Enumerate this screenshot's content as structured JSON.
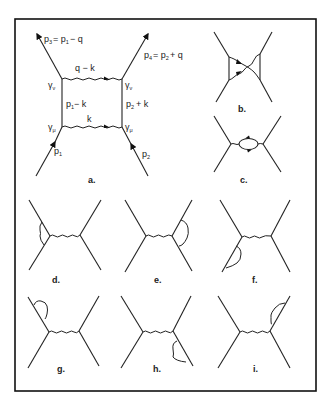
{
  "figure": {
    "panels": [
      {
        "id": "a",
        "caption": "a.",
        "description": "box diagram"
      },
      {
        "id": "b",
        "caption": "b.",
        "description": "crossed box diagram"
      },
      {
        "id": "c",
        "caption": "c.",
        "description": "vacuum polarization"
      },
      {
        "id": "d",
        "caption": "d.",
        "description": "vertex correction left"
      },
      {
        "id": "e",
        "caption": "e.",
        "description": "vertex correction right"
      },
      {
        "id": "f",
        "caption": "f.",
        "description": "self-energy lower-left leg"
      },
      {
        "id": "g",
        "caption": "g.",
        "description": "self-energy upper-left leg"
      },
      {
        "id": "h",
        "caption": "h.",
        "description": "self-energy lower-right leg"
      },
      {
        "id": "i",
        "caption": "i.",
        "description": "self-energy upper-right leg"
      }
    ],
    "panel_a_labels": {
      "p3": "p",
      "p3_sub": "3",
      "p3_eq": "= p",
      "p3_eq_sub": "1",
      "p3_rest": "− q",
      "p4": "p",
      "p4_sub": "4",
      "p4_eq": "= p",
      "p4_eq_sub": "2",
      "p4_rest": "+ q",
      "top_photon": "q − k",
      "bottom_photon": "k",
      "left_prop": "p",
      "left_prop_sub": "1",
      "left_prop_rest": "− k",
      "right_prop": "p",
      "right_prop_sub": "2",
      "right_prop_rest": "+ k",
      "gamma_nu_left": "γ",
      "gamma_nu_left_sub": "ν",
      "gamma_nu_right": "γ",
      "gamma_nu_right_sub": "ν",
      "gamma_mu_left": "γ",
      "gamma_mu_left_sub": "μ",
      "gamma_mu_right": "γ",
      "gamma_mu_right_sub": "μ",
      "p1": "p",
      "p1_sub": "1",
      "p2": "p",
      "p2_sub": "2"
    }
  }
}
